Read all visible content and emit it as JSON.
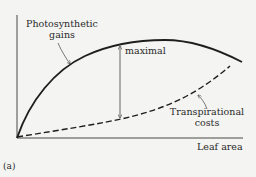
{
  "figure": {
    "panel_label": "(a)",
    "x_axis_label": "Leaf area",
    "curves": [
      {
        "name": "Photosynthetic gains",
        "label_line1": "Photosynthetic",
        "label_line2": "gains",
        "style": "solid"
      },
      {
        "name": "Transpirational costs",
        "label_line1": "Transpirational",
        "label_line2": "costs",
        "style": "dashed"
      }
    ],
    "annotation": {
      "label": "maximal",
      "type": "double-arrow",
      "meaning": "maximal difference between gains and costs"
    }
  },
  "colors": {
    "background": "#f4f4f2",
    "ink": "#1e1e1e",
    "arrow": "#555555"
  }
}
